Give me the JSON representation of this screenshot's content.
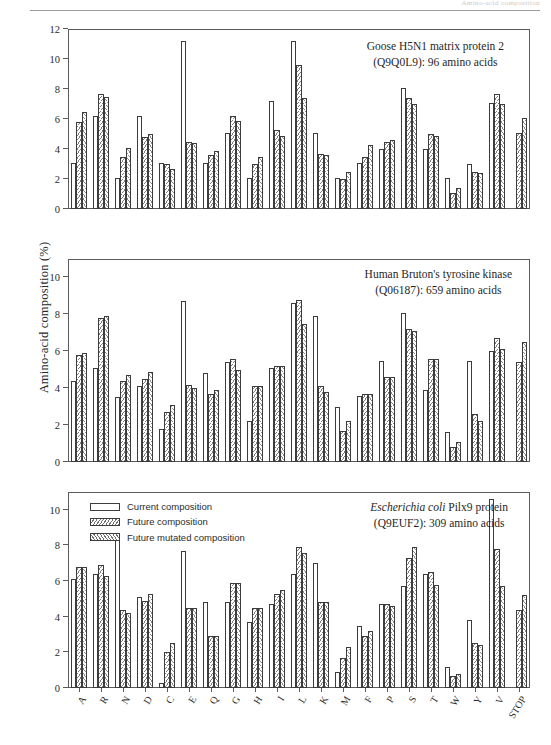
{
  "page": {
    "header_text": "Amino-acid composition",
    "folio": ""
  },
  "axis": {
    "ylabel": "Amino-acid composition (%)",
    "categories": [
      "A",
      "R",
      "N",
      "D",
      "C",
      "E",
      "Q",
      "G",
      "H",
      "I",
      "L",
      "K",
      "M",
      "F",
      "P",
      "S",
      "T",
      "W",
      "Y",
      "V",
      "STOP"
    ]
  },
  "legend": {
    "items": [
      {
        "label": "Current composition",
        "style": "s-current"
      },
      {
        "label": "Future composition",
        "style": "s-future"
      },
      {
        "label": "Future mutated composition",
        "style": "s-mutated"
      }
    ]
  },
  "chart_data": [
    {
      "type": "bar",
      "title": "Goose H5N1 matrix protein 2",
      "subtitle": "(Q9Q0L9): 96 amino acids",
      "title_italic_prefix": "",
      "xlabel": "",
      "ylabel": "Amino-acid composition (%)",
      "ylim": [
        0,
        12
      ],
      "yticks": [
        0,
        2,
        4,
        6,
        8,
        10,
        12
      ],
      "grid": false,
      "categories": [
        "A",
        "R",
        "N",
        "D",
        "C",
        "E",
        "Q",
        "G",
        "H",
        "I",
        "L",
        "K",
        "M",
        "F",
        "P",
        "S",
        "T",
        "W",
        "Y",
        "V",
        "STOP"
      ],
      "series": [
        {
          "name": "Current composition",
          "values": [
            3.1,
            6.2,
            2.1,
            6.2,
            3.1,
            11.2,
            3.1,
            5.1,
            2.1,
            7.2,
            11.2,
            5.1,
            2.1,
            3.1,
            4.0,
            8.1,
            4.0,
            2.1,
            3.0,
            7.1,
            0.0
          ]
        },
        {
          "name": "Future composition",
          "values": [
            5.8,
            7.7,
            3.5,
            4.8,
            3.0,
            4.5,
            3.6,
            6.2,
            3.0,
            5.3,
            9.6,
            3.7,
            2.0,
            3.5,
            4.5,
            7.4,
            5.0,
            1.1,
            2.5,
            7.7,
            5.1
          ]
        },
        {
          "name": "Future mutated composition",
          "values": [
            6.5,
            7.5,
            4.1,
            5.0,
            2.7,
            4.4,
            3.9,
            5.9,
            3.5,
            4.9,
            7.4,
            3.6,
            2.5,
            4.3,
            4.6,
            7.0,
            4.9,
            1.4,
            2.4,
            7.0,
            6.1
          ]
        }
      ]
    },
    {
      "type": "bar",
      "title": "Human Bruton's tyrosine kinase",
      "subtitle": "(Q06187): 659 amino acids",
      "title_italic_prefix": "",
      "xlabel": "",
      "ylabel": "Amino-acid composition (%)",
      "ylim": [
        0,
        11
      ],
      "yticks": [
        0,
        2,
        4,
        6,
        8,
        10
      ],
      "grid": false,
      "categories": [
        "A",
        "R",
        "N",
        "D",
        "C",
        "E",
        "Q",
        "G",
        "H",
        "I",
        "L",
        "K",
        "M",
        "F",
        "P",
        "S",
        "T",
        "W",
        "Y",
        "V",
        "STOP"
      ],
      "series": [
        {
          "name": "Current composition",
          "values": [
            4.4,
            5.1,
            3.5,
            4.1,
            1.8,
            8.7,
            4.8,
            5.4,
            2.2,
            5.1,
            8.6,
            7.9,
            3.0,
            3.6,
            5.5,
            8.1,
            3.9,
            1.6,
            5.5,
            6.0,
            0.0
          ]
        },
        {
          "name": "Future composition",
          "values": [
            5.8,
            7.8,
            4.4,
            4.5,
            2.7,
            4.2,
            3.7,
            5.6,
            4.1,
            5.2,
            8.8,
            4.1,
            1.7,
            3.7,
            4.6,
            7.2,
            5.6,
            0.8,
            2.6,
            6.7,
            5.4
          ]
        },
        {
          "name": "Future mutated composition",
          "values": [
            5.9,
            7.9,
            4.7,
            4.9,
            3.1,
            4.0,
            3.9,
            5.0,
            4.1,
            5.2,
            7.5,
            3.8,
            2.2,
            3.7,
            4.6,
            7.1,
            5.6,
            1.1,
            2.2,
            6.1,
            6.5
          ]
        }
      ]
    },
    {
      "type": "bar",
      "title": "Pilx9 protein",
      "subtitle": "(Q9EUF2): 309 amino acids",
      "title_italic_prefix": "Escherichia coli",
      "xlabel": "",
      "ylabel": "Amino-acid composition (%)",
      "ylim": [
        0,
        11
      ],
      "yticks": [
        0,
        2,
        4,
        6,
        8,
        10
      ],
      "grid": false,
      "categories": [
        "A",
        "R",
        "N",
        "D",
        "C",
        "E",
        "Q",
        "G",
        "H",
        "I",
        "L",
        "K",
        "M",
        "F",
        "P",
        "S",
        "T",
        "W",
        "Y",
        "V",
        "STOP"
      ],
      "series": [
        {
          "name": "Current composition",
          "values": [
            6.1,
            6.4,
            8.4,
            5.1,
            0.3,
            7.7,
            4.8,
            4.8,
            3.7,
            4.7,
            6.4,
            7.0,
            0.9,
            3.5,
            4.7,
            5.7,
            6.4,
            1.2,
            3.8,
            10.6,
            0.0
          ]
        },
        {
          "name": "Future composition",
          "values": [
            6.8,
            6.9,
            4.4,
            4.9,
            2.0,
            4.5,
            2.9,
            5.9,
            4.5,
            5.3,
            7.9,
            4.8,
            1.7,
            2.9,
            4.7,
            7.3,
            6.5,
            0.7,
            2.5,
            7.8,
            4.4
          ]
        },
        {
          "name": "Future mutated composition",
          "values": [
            6.8,
            6.3,
            4.2,
            5.3,
            2.5,
            4.5,
            2.9,
            5.9,
            4.5,
            5.5,
            7.6,
            4.8,
            2.3,
            3.2,
            4.6,
            7.9,
            5.8,
            0.8,
            2.4,
            5.7,
            5.2
          ]
        }
      ]
    }
  ]
}
